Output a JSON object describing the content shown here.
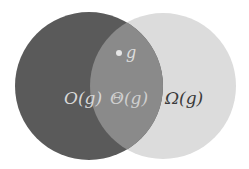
{
  "diagram": {
    "type": "venn",
    "sets": [
      {
        "id": "left",
        "label": "O(g)",
        "color": "#5a5a5a",
        "label_color": "#d8d8d8"
      },
      {
        "id": "right",
        "label": "Ω(g)",
        "color": "#dcdcdc",
        "label_color": "#3a3a3a"
      }
    ],
    "intersection": {
      "label": "Θ(g)",
      "color": "#8a8a8a",
      "label_color": "#cfcfcf"
    },
    "point": {
      "label": "g",
      "dot_color": "#e6e6e6",
      "label_color": "#dcdcdc"
    }
  }
}
